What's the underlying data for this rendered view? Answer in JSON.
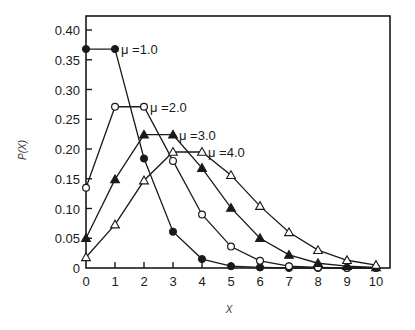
{
  "chart_data": {
    "type": "line",
    "title": "",
    "xlabel": "X",
    "ylabel": "P(X)",
    "xlim": [
      0,
      10
    ],
    "ylim": [
      0,
      0.4
    ],
    "grid": false,
    "legend_position": "inline labels at curve peaks",
    "x_ticks": [
      "0",
      "1",
      "2",
      "3",
      "4",
      "5",
      "6",
      "7",
      "8",
      "9",
      "10"
    ],
    "y_ticks": [
      "0",
      "0.05",
      "0.10",
      "0.15",
      "0.20",
      "0.25",
      "0.30",
      "0.35",
      "0.40"
    ],
    "x": [
      0,
      1,
      2,
      3,
      4,
      5,
      6,
      7,
      8,
      9,
      10
    ],
    "series": [
      {
        "name": "μ=1.0",
        "label": "μ =1.0",
        "marker": "filled-circle",
        "values": [
          0.368,
          0.368,
          0.184,
          0.061,
          0.015,
          0.003,
          0.001,
          0.0,
          0.0,
          0.0,
          0.0
        ]
      },
      {
        "name": "μ=2.0",
        "label": "μ =2.0",
        "marker": "open-circle",
        "values": [
          0.135,
          0.271,
          0.271,
          0.18,
          0.09,
          0.036,
          0.012,
          0.003,
          0.001,
          0.0,
          0.0
        ]
      },
      {
        "name": "μ=3.0",
        "label": "μ =3.0",
        "marker": "filled-triangle",
        "values": [
          0.05,
          0.149,
          0.224,
          0.224,
          0.168,
          0.101,
          0.05,
          0.022,
          0.008,
          0.003,
          0.001
        ]
      },
      {
        "name": "μ=4.0",
        "label": "μ =4.0",
        "marker": "open-triangle",
        "values": [
          0.018,
          0.073,
          0.147,
          0.195,
          0.195,
          0.156,
          0.104,
          0.06,
          0.03,
          0.013,
          0.005
        ]
      }
    ]
  }
}
